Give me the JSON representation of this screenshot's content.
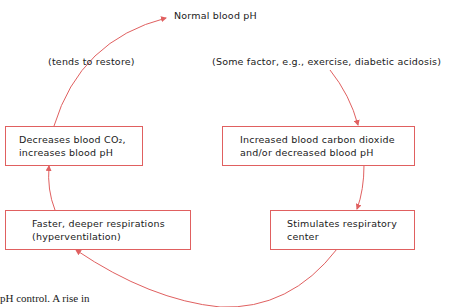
{
  "top_label": "Normal blood pH",
  "left_note": "(tends to restore)",
  "right_note": "(Some factor, e.g., exercise, diabetic acidosis)",
  "boxes": {
    "decreases": {
      "line1": "Decreases blood CO₂,",
      "line2": "increases blood pH"
    },
    "increased": {
      "line1": "Increased blood carbon dioxide",
      "line2": "and/or decreased blood pH"
    },
    "faster": {
      "line1": "Faster, deeper respirations",
      "line2": "(hyperventilation)"
    },
    "stimulates": {
      "line1": "Stimulates respiratory",
      "line2": "center"
    }
  },
  "caption_fragment": "pH control. A rise in",
  "colors": {
    "arrow": "#e06060",
    "box_border": "#e06060"
  }
}
